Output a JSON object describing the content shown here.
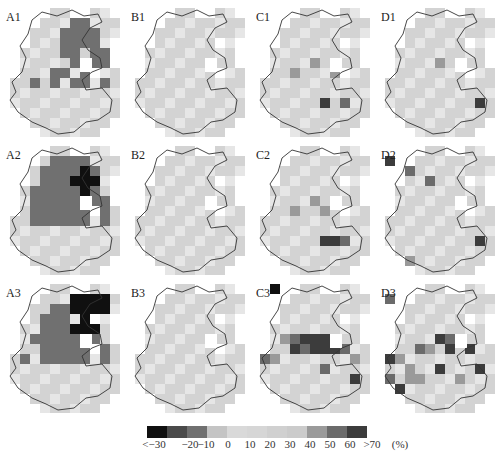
{
  "chart_data": {
    "type": "heatmap",
    "title": "",
    "layout": "3 rows x 4 columns of gridded maps",
    "units": "%",
    "legend": {
      "labels": [
        "<-30",
        "-20",
        "-10",
        "0",
        "10",
        "20",
        "30",
        "40",
        "50",
        "60",
        ">70",
        "(%)"
      ],
      "colors": [
        "#101010",
        "#4a4a4a",
        "#707070",
        "#c4c4c4",
        "#d9d9d9",
        "#d6d6d6",
        "#d0d0d0",
        "#cbcbcb",
        "#9a9a9a",
        "#6b6b6b",
        "#3c3c3c"
      ],
      "bins": [
        "<-30",
        "-30~-20",
        "-20~-10",
        "-10~0",
        "0~10",
        "10~20",
        "20~30",
        "30~40",
        "40~50",
        "50~60",
        ">70"
      ]
    },
    "panels": [
      {
        "id": "A1",
        "description": "dark (-20~-10) block over northern/northeastern part, rest light (0~10)"
      },
      {
        "id": "B1",
        "description": "uniformly light (0~10)"
      },
      {
        "id": "C1",
        "description": "mostly light; few medium cells center; darker cell at east coast"
      },
      {
        "id": "D1",
        "description": "mostly light; dark cell at east coast"
      },
      {
        "id": "A2",
        "description": "dark (-20~-10) over northern half, black (<-30) cluster in northeast"
      },
      {
        "id": "B2",
        "description": "uniformly light (0~10)"
      },
      {
        "id": "C2",
        "description": "mostly light; medium cells center; dark cells southeast coast"
      },
      {
        "id": "D2",
        "description": "mostly light; a few dark cells north; dark east coast cell"
      },
      {
        "id": "A3",
        "description": "dark (-20~-10) over northern half, large black (<-30) region in north"
      },
      {
        "id": "B3",
        "description": "uniformly light (0~10)"
      },
      {
        "id": "C3",
        "description": "band of dark (50~>70) cells across middle latitude, east coast dark"
      },
      {
        "id": "D3",
        "description": "scattered dark/medium cells across middle and south band"
      }
    ]
  },
  "panels": [
    {
      "label": "A1"
    },
    {
      "label": "B1"
    },
    {
      "label": "C1"
    },
    {
      "label": "D1"
    },
    {
      "label": "A2"
    },
    {
      "label": "B2"
    },
    {
      "label": "C2"
    },
    {
      "label": "D2"
    },
    {
      "label": "A3"
    },
    {
      "label": "B3"
    },
    {
      "label": "C3"
    },
    {
      "label": "D3"
    }
  ],
  "legend": {
    "ticks": [
      {
        "text": "<−30",
        "x": 14
      },
      {
        "text": "−20",
        "x": 50
      },
      {
        "text": "−10",
        "x": 66
      },
      {
        "text": "0",
        "x": 88
      },
      {
        "text": "10",
        "x": 110
      },
      {
        "text": "20",
        "x": 130
      },
      {
        "text": "30",
        "x": 150
      },
      {
        "text": "40",
        "x": 170
      },
      {
        "text": "50",
        "x": 190
      },
      {
        "text": "60",
        "x": 210
      },
      {
        "text": ">70",
        "x": 232
      },
      {
        "text": "(%)",
        "x": 260
      }
    ]
  }
}
